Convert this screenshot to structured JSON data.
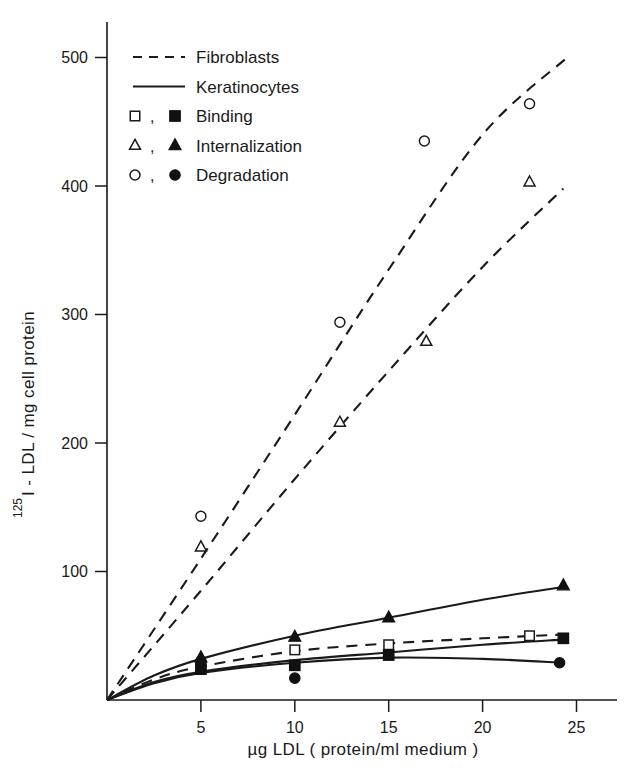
{
  "chart_data": {
    "type": "scatter",
    "title": "",
    "xlabel": "µg LDL ( protein/ml medium )",
    "ylabel": "I - LDL / mg cell protein",
    "ylabel_superscript": "125",
    "xlim": [
      0,
      26.5
    ],
    "ylim": [
      0,
      530
    ],
    "xticks": [
      5,
      10,
      15,
      20,
      25
    ],
    "yticks": [
      100,
      200,
      300,
      400,
      500
    ],
    "grid": false,
    "legend_position": "top-left",
    "legend": [
      {
        "key": "fibroblasts",
        "label": "Fibroblasts",
        "style": "dashed-line"
      },
      {
        "key": "keratinocytes",
        "label": "Keratinocytes",
        "style": "solid-line"
      },
      {
        "key": "binding",
        "label": "Binding",
        "open_marker": "square",
        "filled_marker": "square"
      },
      {
        "key": "internalization",
        "label": "Internalization",
        "open_marker": "triangle",
        "filled_marker": "triangle"
      },
      {
        "key": "degradation",
        "label": "Degradation",
        "open_marker": "circle",
        "filled_marker": "circle"
      }
    ],
    "series": [
      {
        "name": "Fibroblasts Degradation",
        "cell_type": "Fibroblasts",
        "process": "Degradation",
        "marker": "open-circle",
        "line": "dashed",
        "points": [
          {
            "x": 5.0,
            "y": 143
          },
          {
            "x": 12.4,
            "y": 294
          },
          {
            "x": 16.9,
            "y": 435
          },
          {
            "x": 22.5,
            "y": 464
          }
        ],
        "fit_curve": [
          {
            "x": 0,
            "y": 0
          },
          {
            "x": 5,
            "y": 110
          },
          {
            "x": 10,
            "y": 222
          },
          {
            "x": 15,
            "y": 335
          },
          {
            "x": 20,
            "y": 440
          },
          {
            "x": 24.5,
            "y": 500
          }
        ]
      },
      {
        "name": "Fibroblasts Internalization",
        "cell_type": "Fibroblasts",
        "process": "Internalization",
        "marker": "open-triangle",
        "line": "dashed",
        "points": [
          {
            "x": 5.0,
            "y": 119
          },
          {
            "x": 12.4,
            "y": 216
          },
          {
            "x": 17.0,
            "y": 279
          },
          {
            "x": 22.5,
            "y": 403
          }
        ],
        "fit_curve": [
          {
            "x": 0,
            "y": 0
          },
          {
            "x": 5,
            "y": 85
          },
          {
            "x": 10,
            "y": 172
          },
          {
            "x": 15,
            "y": 256
          },
          {
            "x": 20,
            "y": 337
          },
          {
            "x": 24.3,
            "y": 398
          }
        ]
      },
      {
        "name": "Fibroblasts Binding",
        "cell_type": "Fibroblasts",
        "process": "Binding",
        "marker": "open-square",
        "line": "dashed",
        "points": [
          {
            "x": 5.0,
            "y": 26
          },
          {
            "x": 10.0,
            "y": 39
          },
          {
            "x": 15.0,
            "y": 43
          },
          {
            "x": 22.5,
            "y": 50
          }
        ],
        "fit_curve": [
          {
            "x": 0,
            "y": 0
          },
          {
            "x": 2.5,
            "y": 16
          },
          {
            "x": 5,
            "y": 26
          },
          {
            "x": 10,
            "y": 38
          },
          {
            "x": 15,
            "y": 44
          },
          {
            "x": 20,
            "y": 48
          },
          {
            "x": 24.3,
            "y": 51
          }
        ]
      },
      {
        "name": "Keratinocytes Internalization",
        "cell_type": "Keratinocytes",
        "process": "Internalization",
        "marker": "filled-triangle",
        "line": "solid",
        "points": [
          {
            "x": 5.0,
            "y": 33
          },
          {
            "x": 10.0,
            "y": 49
          },
          {
            "x": 15.0,
            "y": 64
          },
          {
            "x": 24.3,
            "y": 89
          }
        ],
        "fit_curve": [
          {
            "x": 0,
            "y": 0
          },
          {
            "x": 2.5,
            "y": 19
          },
          {
            "x": 5,
            "y": 32
          },
          {
            "x": 10,
            "y": 50
          },
          {
            "x": 15,
            "y": 64
          },
          {
            "x": 20,
            "y": 78
          },
          {
            "x": 24.3,
            "y": 88
          }
        ]
      },
      {
        "name": "Keratinocytes Binding",
        "cell_type": "Keratinocytes",
        "process": "Binding",
        "marker": "filled-square",
        "line": "solid",
        "points": [
          {
            "x": 5.0,
            "y": 24
          },
          {
            "x": 10.0,
            "y": 27
          },
          {
            "x": 15.0,
            "y": 35
          },
          {
            "x": 24.3,
            "y": 48
          }
        ],
        "fit_curve": [
          {
            "x": 0,
            "y": 0
          },
          {
            "x": 2.5,
            "y": 14
          },
          {
            "x": 5,
            "y": 22
          },
          {
            "x": 10,
            "y": 31
          },
          {
            "x": 15,
            "y": 37
          },
          {
            "x": 20,
            "y": 43
          },
          {
            "x": 24.3,
            "y": 47
          }
        ]
      },
      {
        "name": "Keratinocytes Degradation",
        "cell_type": "Keratinocytes",
        "process": "Degradation",
        "marker": "filled-circle",
        "line": "solid",
        "points": [
          {
            "x": 5.0,
            "y": 30
          },
          {
            "x": 10.0,
            "y": 17
          },
          {
            "x": 24.1,
            "y": 29
          }
        ],
        "fit_curve": [
          {
            "x": 0,
            "y": 0
          },
          {
            "x": 2.5,
            "y": 13
          },
          {
            "x": 5,
            "y": 21
          },
          {
            "x": 10,
            "y": 29
          },
          {
            "x": 15,
            "y": 33
          },
          {
            "x": 20,
            "y": 32
          },
          {
            "x": 24.3,
            "y": 29
          }
        ]
      }
    ]
  }
}
